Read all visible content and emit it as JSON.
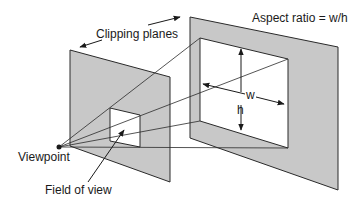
{
  "diagram": {
    "labels": {
      "aspect_ratio": "Aspect ratio = w/h",
      "clipping_planes": "Clipping planes",
      "viewpoint": "Viewpoint",
      "field_of_view": "Field of view",
      "width": "w",
      "height": "h"
    },
    "colors": {
      "plane_fill": "#c8c8c8",
      "window_fill": "#ffffff",
      "stroke": "#2a2a2a",
      "background": "#ffffff"
    },
    "nodes": [
      {
        "id": "viewpoint",
        "label": "Viewpoint"
      },
      {
        "id": "near-plane",
        "label": "near clipping plane"
      },
      {
        "id": "far-plane",
        "label": "far clipping plane"
      }
    ]
  }
}
